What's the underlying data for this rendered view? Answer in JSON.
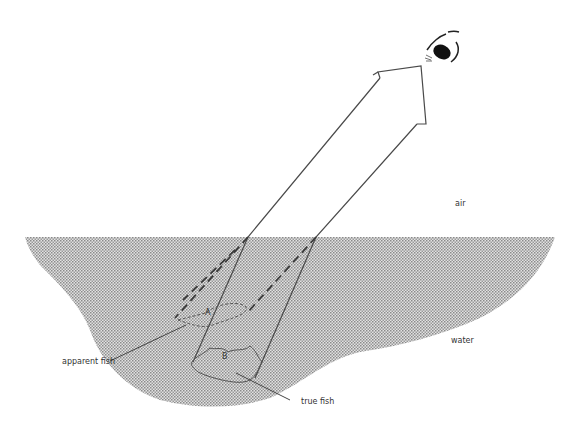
{
  "diagram": {
    "labels": {
      "air": "air",
      "water": "water",
      "apparent_fish": "apparent fish",
      "true_fish": "true fish",
      "fish_a": "A",
      "fish_b": "B"
    },
    "colors": {
      "water_fill": "#bdbdbd",
      "line": "#444444",
      "background": "#ffffff"
    }
  }
}
